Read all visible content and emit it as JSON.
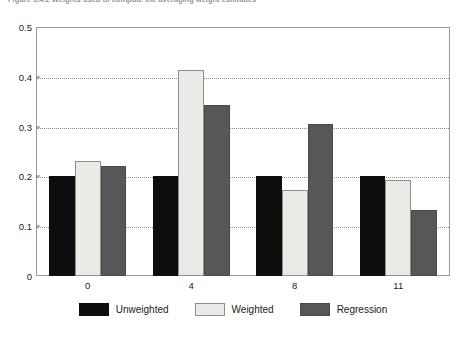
{
  "figure": {
    "caption": "Figure 3.4.2   Weights used to compute the averaging weight estimates"
  },
  "chart_data": {
    "type": "bar",
    "title": "",
    "xlabel": "",
    "ylabel": "",
    "categories": [
      "0",
      "4",
      "8",
      "11"
    ],
    "series": [
      {
        "name": "Unweighted",
        "color": "#0d0d0d",
        "values": [
          0.201,
          0.201,
          0.201,
          0.201
        ]
      },
      {
        "name": "Weighted",
        "color": "#eceae6",
        "values": [
          0.231,
          0.413,
          0.172,
          0.193
        ]
      },
      {
        "name": "Regression",
        "color": "#575757",
        "values": [
          0.221,
          0.344,
          0.306,
          0.133
        ]
      }
    ],
    "ylim": [
      0,
      0.5
    ],
    "yticks": [
      0,
      0.1,
      0.2,
      0.3,
      0.4,
      0.5
    ],
    "ytick_labels": [
      "0",
      "0.1",
      "0.2",
      "0.3",
      "0.4",
      "0.5"
    ],
    "grid": true,
    "grid_axis": "y",
    "grid_style": "dotted",
    "legend_position": "bottom"
  }
}
